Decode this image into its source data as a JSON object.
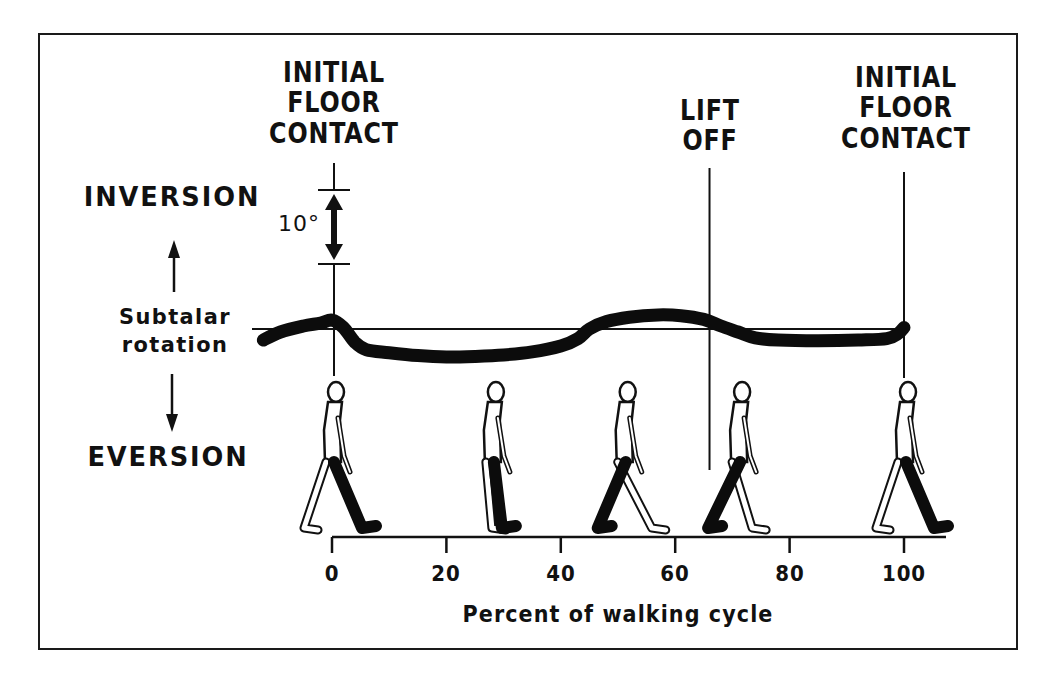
{
  "chart_data": {
    "type": "line",
    "title": "",
    "xlabel": "Percent of walking cycle",
    "ylabel": "Subtalar rotation",
    "y_positive_label": "INVERSION",
    "y_negative_label": "EVERSION",
    "y_unit": "degrees",
    "scale_bar": {
      "label": "10°",
      "value": 10
    },
    "xlim": [
      -13,
      108
    ],
    "x_ticks": [
      0,
      20,
      40,
      60,
      80,
      100
    ],
    "grid": false,
    "series": [
      {
        "name": "Subtalar rotation",
        "x": [
          -12,
          -9,
          -5,
          -2,
          0,
          2,
          4,
          6,
          10,
          15,
          20,
          25,
          30,
          35,
          40,
          43,
          45,
          48,
          52,
          57,
          61,
          65,
          68,
          71,
          74,
          78,
          85,
          92,
          97,
          99,
          100
        ],
        "values": [
          -1.5,
          -0.4,
          0.4,
          0.8,
          1.2,
          0.2,
          -1.8,
          -2.8,
          -3.2,
          -3.6,
          -3.8,
          -3.7,
          -3.5,
          -3.1,
          -2.3,
          -1.3,
          0.0,
          1.0,
          1.6,
          1.9,
          1.8,
          1.3,
          0.4,
          -0.4,
          -1.2,
          -1.5,
          -1.6,
          -1.5,
          -1.3,
          -0.6,
          0.2
        ]
      }
    ],
    "events": [
      {
        "name": "Initial floor contact",
        "x": 0
      },
      {
        "name": "Lift off",
        "x": 66
      },
      {
        "name": "Initial floor contact",
        "x": 100
      }
    ],
    "figures_at_percent": [
      0,
      29,
      51,
      71,
      100
    ]
  },
  "labels": {
    "event_left": [
      "INITIAL",
      "FLOOR",
      "CONTACT"
    ],
    "event_mid": [
      "LIFT",
      "OFF"
    ],
    "event_right": [
      "INITIAL",
      "FLOOR",
      "CONTACT"
    ],
    "inversion": "INVERSION",
    "eversion": "EVERSION",
    "subtalar": [
      "Subtalar",
      "rotation"
    ],
    "degree": "10°",
    "xlabel": "Percent of walking cycle",
    "ticks": [
      "0",
      "20",
      "40",
      "60",
      "80",
      "100"
    ]
  }
}
